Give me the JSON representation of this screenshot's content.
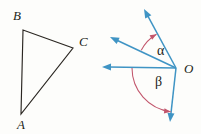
{
  "figure": {
    "background_color": "#fdfdfb",
    "triangle": {
      "name": "triangle-abc",
      "stroke_color": "#2b2722",
      "vertices": [
        {
          "id": "A",
          "label": "A",
          "x": 21,
          "y": 114,
          "label_x": 17,
          "label_y": 129
        },
        {
          "id": "B",
          "label": "B",
          "x": 23,
          "y": 30,
          "label_x": 13,
          "label_y": 20
        },
        {
          "id": "C",
          "label": "C",
          "x": 73,
          "y": 48,
          "label_x": 79,
          "label_y": 46
        }
      ]
    },
    "angle_diagram": {
      "name": "angle-diagram-o",
      "ray_color": "#3f94c4",
      "arc_color": "#c2566c",
      "vertex": {
        "id": "O",
        "label": "O",
        "x": 176,
        "y": 68,
        "label_x": 184,
        "label_y": 73
      },
      "rays": [
        {
          "id": "ray-up",
          "label": "upper ray",
          "tip_x": 144,
          "tip_y": 9,
          "angle_deg": 120
        },
        {
          "id": "ray-upper-left",
          "label": "upper-left ray",
          "tip_x": 110,
          "tip_y": 37,
          "angle_deg": 153
        },
        {
          "id": "ray-horizontal-left",
          "label": "horizontal left ray",
          "tip_x": 102,
          "tip_y": 67,
          "angle_deg": 180
        },
        {
          "id": "ray-down",
          "label": "lower ray",
          "tip_x": 170,
          "tip_y": 122,
          "angle_deg": 263
        }
      ],
      "angles": [
        {
          "id": "alpha",
          "label": "α",
          "label_x": 157,
          "label_y": 55,
          "arc_radius": 39,
          "start_deg": 153,
          "end_deg": 120,
          "between": "upper-left ray and upper ray"
        },
        {
          "id": "beta",
          "label": "β",
          "label_x": 155,
          "label_y": 86,
          "arc_radius": 44,
          "start_deg": 180,
          "end_deg": 263,
          "between": "horizontal left ray and lower ray"
        }
      ]
    }
  }
}
